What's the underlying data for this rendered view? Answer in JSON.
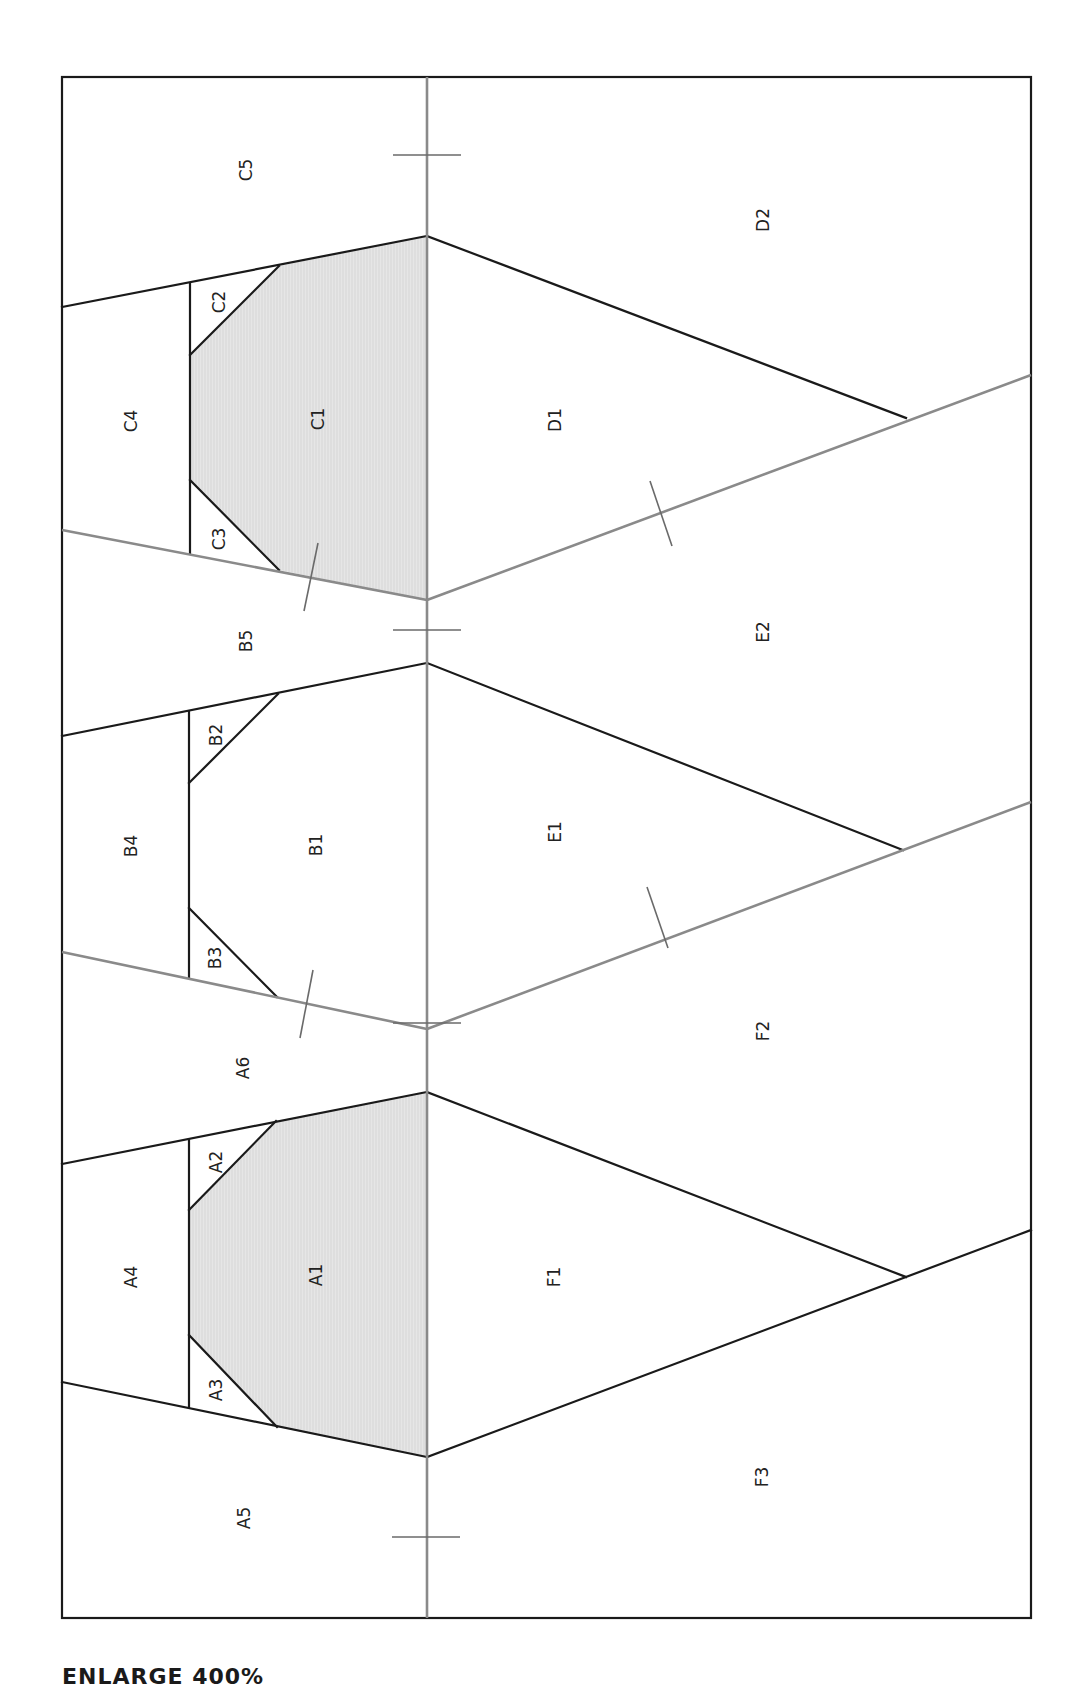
{
  "diagram": {
    "type": "foundation paper piecing pattern",
    "orientation": "rotated 90° (labels read bottom-to-top)",
    "colors": {
      "outline": "#1a1a1a",
      "seam_line": "#8a8a8a",
      "shaded_fill": "#e4e4e4",
      "background": "#ffffff"
    },
    "sections": {
      "A": [
        "A1",
        "A2",
        "A3",
        "A4",
        "A5",
        "A6"
      ],
      "B": [
        "B1",
        "B2",
        "B3",
        "B4",
        "B5"
      ],
      "C": [
        "C1",
        "C2",
        "C3",
        "C4",
        "C5"
      ],
      "D": [
        "D1",
        "D2"
      ],
      "E": [
        "E1",
        "E2"
      ],
      "F": [
        "F1",
        "F2",
        "F3"
      ]
    },
    "shaded_pieces": [
      "A1",
      "C1"
    ],
    "labels": {
      "C5": "C5",
      "C4": "C4",
      "C2": "C2",
      "C1": "C1",
      "C3": "C3",
      "B5": "B5",
      "B4": "B4",
      "B2": "B2",
      "B1": "B1",
      "B3": "B3",
      "A6": "A6",
      "A4": "A4",
      "A2": "A2",
      "A1": "A1",
      "A3": "A3",
      "A5": "A5",
      "D2": "D2",
      "D1": "D1",
      "E2": "E2",
      "E1": "E1",
      "F2": "F2",
      "F1": "F1",
      "F3": "F3"
    }
  },
  "footer": {
    "instruction": "ENLARGE 400%"
  }
}
